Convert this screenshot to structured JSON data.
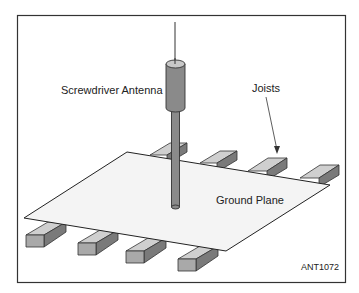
{
  "figure": {
    "labels": {
      "antenna": "Screwdriver Antenna",
      "joists": "Joists",
      "ground_plane": "Ground Plane"
    },
    "figure_code": "ANT1072"
  },
  "colors": {
    "border": "#333333",
    "plane_fill": "#f4f4f4",
    "plane_edge": "#222222",
    "joist_top": "#cfcfcf",
    "joist_side": "#7a7a7a",
    "joist_end": "#a9a9a9",
    "antenna_body": "#8a8a8a",
    "antenna_top": "#c8c8c8"
  }
}
